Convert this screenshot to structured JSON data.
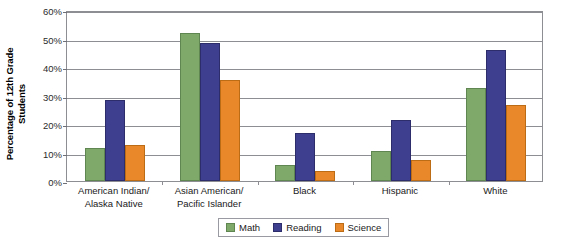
{
  "chart_data": {
    "type": "bar",
    "title": "",
    "xlabel": "",
    "ylabel": "Percentage of 12th Grade Students",
    "ylabel_line1": "Percentage of 12th Grade",
    "ylabel_line2": "Students",
    "ylim": [
      0,
      60
    ],
    "ytick_step": 10,
    "ytick_labels": [
      "60%",
      "50%",
      "40%",
      "30%",
      "20%",
      "10%",
      "0%"
    ],
    "ytick_values": [
      60,
      50,
      40,
      30,
      20,
      10,
      0
    ],
    "grid": true,
    "legend_position": "bottom-center",
    "categories": [
      "American Indian/ Alaska Native",
      "Asian American/ Pacific Islander",
      "Black",
      "Hispanic",
      "White"
    ],
    "category_lines": [
      [
        "American Indian/",
        "Alaska Native"
      ],
      [
        "Asian American/",
        "Pacific Islander"
      ],
      [
        "Black",
        ""
      ],
      [
        "Hispanic",
        ""
      ],
      [
        "White",
        ""
      ]
    ],
    "series": [
      {
        "name": "Math",
        "color": "#7fa96b",
        "values": [
          11.5,
          52.0,
          5.5,
          10.5,
          32.5
        ]
      },
      {
        "name": "Reading",
        "color": "#3f3f8f",
        "values": [
          28.5,
          48.5,
          17.0,
          21.5,
          46.0
        ]
      },
      {
        "name": "Science",
        "color": "#e8882a",
        "values": [
          12.5,
          35.5,
          3.5,
          7.5,
          26.5
        ]
      }
    ]
  }
}
